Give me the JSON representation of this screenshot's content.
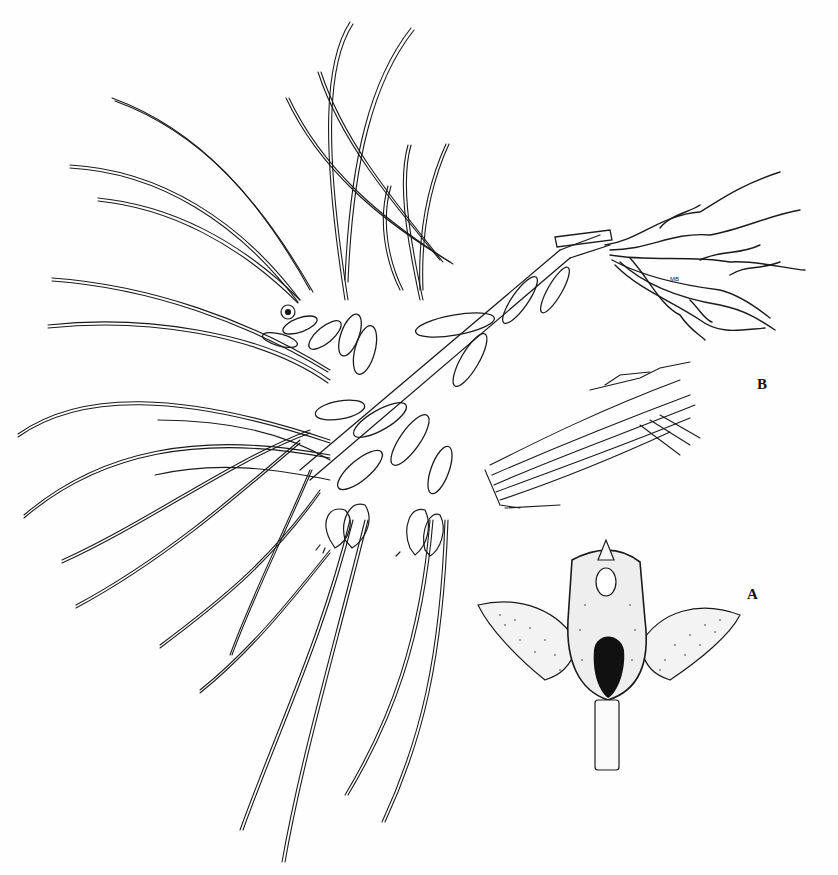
{
  "plate": {
    "caption_fragment": "",
    "figure_labels": {
      "b": "B",
      "a": "A"
    },
    "artist_mark": "MB",
    "subjects": {
      "main": "habit-drawing-orchid-plant",
      "b": "rhizome-root-fragment-detail",
      "a": "flower-front-view-detail"
    },
    "colors": {
      "ink": "#111111",
      "paper": "#fefefe"
    }
  }
}
